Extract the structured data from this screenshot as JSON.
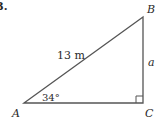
{
  "problem_number": "3.",
  "triangle": {
    "vertices": {
      "A": "A",
      "B": "B",
      "C": "C"
    },
    "hypotenuse_label": "13 m",
    "side_label": "a",
    "angle_label": "34°",
    "right_angle_at": "C"
  },
  "colors": {
    "stroke": "#555555",
    "text": "#2a2a2a"
  }
}
